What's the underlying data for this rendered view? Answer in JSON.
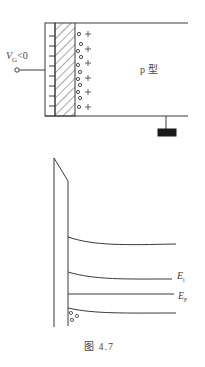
{
  "mos_structure": {
    "gate_label_symbol": "V",
    "gate_label_sub": "G",
    "gate_label_rest": "<0",
    "substrate_label": "p 型",
    "negative_charge_rows": 8,
    "hole_plus_rows": 6
  },
  "band_diagram": {
    "levels": [
      {
        "id": "Ec",
        "label": ""
      },
      {
        "id": "Ei",
        "label_symbol": "E",
        "label_sub": "i"
      },
      {
        "id": "EF",
        "label_symbol": "E",
        "label_sub": "F"
      },
      {
        "id": "Ev",
        "label": ""
      }
    ],
    "hole_count_near_surface": 3
  },
  "caption": "图 4.7",
  "colors": {
    "line": "#3a3a3a",
    "ground": "#1a1a1a",
    "background": "#ffffff"
  }
}
